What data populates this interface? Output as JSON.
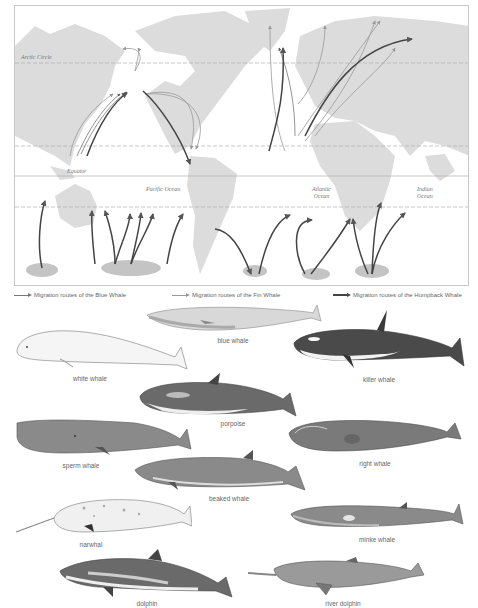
{
  "map": {
    "labels": {
      "arctic_circle": "Arctic Circle",
      "equator": "Equator",
      "pacific_ocean": "Pacific Ocean",
      "atlantic_ocean_line1": "Atlantic",
      "atlantic_ocean_line2": "Ocean",
      "indian_ocean_line1": "Indian",
      "indian_ocean_line2": "Ocean"
    },
    "colors": {
      "land": "#dcdcdc",
      "feeding_grounds": "#c4c4c4",
      "blue_whale_route": "#777777",
      "fin_whale_route": "#9a9a9a",
      "humpback_whale_route": "#444444",
      "latitude_line": "#b0b0b0"
    }
  },
  "legend": {
    "blue_whale": "Migration routes of the Blue Whale",
    "fin_whale": "Migration routes of the Fin Whale",
    "humpback_whale": "Migration routes of the Humpback Whale"
  },
  "animals": {
    "blue_whale": "blue whale",
    "white_whale": "white whale",
    "killer_whale": "killer whale",
    "porpoise": "porpoise",
    "sperm_whale": "sperm whale",
    "right_whale": "right whale",
    "beaked_whale": "beaked whale",
    "narwhal": "narwhal",
    "minke_whale": "minke whale",
    "dolphin": "dolphin",
    "river_dolphin": "river dolphin"
  }
}
